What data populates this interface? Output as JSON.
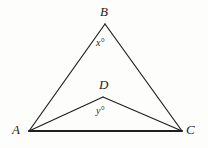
{
  "figure": {
    "type": "geometry-diagram",
    "width": 208,
    "height": 148,
    "background_color": "#fdfdfc",
    "stroke_color": "#1f1f1f",
    "vertices": [
      {
        "id": "A",
        "label": "A",
        "x": 29,
        "y": 131,
        "label_x": 12,
        "label_y": 123
      },
      {
        "id": "B",
        "label": "B",
        "x": 105,
        "y": 24,
        "label_x": 100,
        "label_y": 5
      },
      {
        "id": "C",
        "label": "C",
        "x": 182,
        "y": 131,
        "label_x": 186,
        "label_y": 123
      },
      {
        "id": "D",
        "label": "D",
        "x": 103,
        "y": 97,
        "label_x": 99,
        "label_y": 78
      }
    ],
    "segments": [
      {
        "id": "AB",
        "from": "A",
        "to": "B",
        "x1": 29,
        "y1": 131,
        "x2": 105,
        "y2": 24,
        "width": 1.2
      },
      {
        "id": "BC",
        "from": "B",
        "to": "C",
        "x1": 105,
        "y1": 24,
        "x2": 182,
        "y2": 131,
        "width": 1.2
      },
      {
        "id": "AC",
        "from": "A",
        "to": "C",
        "x1": 29,
        "y1": 131,
        "x2": 182,
        "y2": 131,
        "width": 2
      },
      {
        "id": "AD",
        "from": "A",
        "to": "D",
        "x1": 29,
        "y1": 131,
        "x2": 103,
        "y2": 97,
        "width": 1.2
      },
      {
        "id": "DC",
        "from": "D",
        "to": "C",
        "x1": 103,
        "y1": 97,
        "x2": 182,
        "y2": 131,
        "width": 1.2
      }
    ],
    "angle_labels": [
      {
        "id": "angle-x",
        "text": "x°",
        "at_vertex": "B",
        "x": 96,
        "y": 38
      },
      {
        "id": "angle-y",
        "text": "y°",
        "at_vertex": "D",
        "x": 96,
        "y": 106
      }
    ]
  }
}
